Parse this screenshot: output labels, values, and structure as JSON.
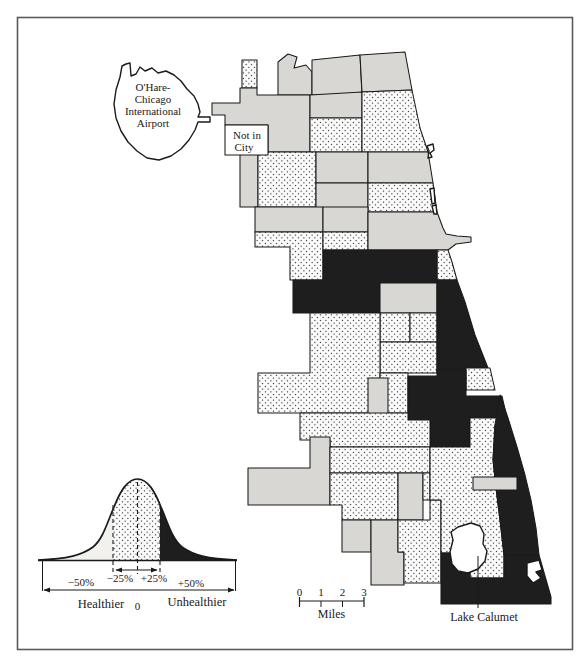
{
  "figure": {
    "colors": {
      "paper": "#ffffff",
      "gray": "#d8d7d3",
      "black": "#1e1e1e",
      "line": "#1a1a1a",
      "frame": "#5a5a5a",
      "light_tail": "#f2f1ed",
      "dot_bg": "#fdfdfd",
      "dot_ink": "#161616"
    },
    "labels": {
      "ohare": [
        "O'Hare-",
        "Chicago",
        "International",
        "Airport"
      ],
      "not_in_city": [
        "Not in",
        "City"
      ],
      "lake_calumet": "Lake Calumet"
    },
    "scale_bar": {
      "ticks": [
        "0",
        "1",
        "2",
        "3"
      ],
      "unit": "Miles"
    },
    "legend": {
      "minus50": "−50%",
      "minus25": "−25%",
      "plus25": "+25%",
      "plus50": "+50%",
      "zero": "0",
      "healthier": "Healthier",
      "unhealthier": "Unhealthier"
    },
    "map_regions": [
      {
        "id": "edison-strip",
        "fill": "dots",
        "pts": "242,60 257,60 257,88 242,88"
      },
      {
        "id": "forest-glen",
        "fill": "gray",
        "pts": "278,62 288,54 297,57 294,68 306,65 312,72 312,95 278,95"
      },
      {
        "id": "norwood-park",
        "fill": "gray",
        "pts": "212,103 240,103 240,88 257,88 257,95 310,95 310,152 268,152 268,125 225,125 225,115 212,115"
      },
      {
        "id": "west-ridge",
        "fill": "gray",
        "pts": "312,60 360,55 362,95 312,95"
      },
      {
        "id": "rogers-park",
        "fill": "gray",
        "pts": "360,55 405,52 412,90 362,92"
      },
      {
        "id": "north-park",
        "fill": "gray",
        "pts": "310,95 362,92 362,118 310,118"
      },
      {
        "id": "albany-park",
        "fill": "dots",
        "pts": "310,118 362,118 362,152 310,152"
      },
      {
        "id": "edgewater-uptown",
        "fill": "dots",
        "pts": "362,92 412,90 420,128 428,152 362,152"
      },
      {
        "id": "dunning",
        "fill": "gray",
        "pts": "240,152 258,152 258,207 240,207"
      },
      {
        "id": "portage-irving",
        "fill": "dots",
        "pts": "258,152 316,152 316,207 258,207"
      },
      {
        "id": "north-center",
        "fill": "gray",
        "pts": "316,152 368,152 368,183 316,183"
      },
      {
        "id": "lincoln-park",
        "fill": "gray",
        "pts": "368,152 428,152 433,183 368,183"
      },
      {
        "id": "lakeview-west",
        "fill": "gray",
        "pts": "316,183 368,183 368,212 316,212"
      },
      {
        "id": "near-north",
        "fill": "dots",
        "pts": "368,183 433,183 437,212 368,212"
      },
      {
        "id": "belmont-hermosa",
        "fill": "gray",
        "pts": "255,207 323,207 323,232 255,232"
      },
      {
        "id": "austin",
        "fill": "dots",
        "pts": "255,232 323,232 323,280 290,280 290,247 255,247"
      },
      {
        "id": "logan-square",
        "fill": "gray",
        "pts": "323,207 368,207 368,232 323,232"
      },
      {
        "id": "humboldt",
        "fill": "dots",
        "pts": "323,232 368,232 368,250 323,250"
      },
      {
        "id": "loop-near-north",
        "fill": "gray",
        "pts": "368,212 437,212 443,228 446,234 457,236 471,237 471,242 456,244 448,250 368,250"
      },
      {
        "id": "douglas-shore",
        "fill": "dots",
        "pts": "437,250 448,250 452,262 457,280 437,280"
      },
      {
        "id": "west-side-black",
        "fill": "black",
        "pts": "323,250 437,250 437,283 380,283 380,313 293,313 293,280 323,280"
      },
      {
        "id": "near-south-gray",
        "fill": "gray",
        "pts": "380,283 437,283 437,313 380,313"
      },
      {
        "id": "washington-park",
        "fill": "dots",
        "pts": "380,313 410,313 410,342 380,342"
      },
      {
        "id": "hyde-park-west",
        "fill": "dots",
        "pts": "410,313 437,313 437,342 410,342"
      },
      {
        "id": "woodlawn",
        "fill": "dots",
        "pts": "380,342 437,342 437,373 380,373"
      },
      {
        "id": "lakefront-black",
        "fill": "black",
        "pts": "437,280 457,280 465,302 475,335 488,368 466,368 466,373 437,373"
      },
      {
        "id": "south-shore-dots",
        "fill": "dots",
        "pts": "466,368 490,368 495,390 466,390"
      },
      {
        "id": "pilsen-littlevillage",
        "fill": "dots",
        "pts": "310,313 380,313 380,413 258,413 258,373 310,373"
      },
      {
        "id": "gage-strip",
        "fill": "dots",
        "pts": "380,373 408,373 408,413 380,413"
      },
      {
        "id": "brighton-gray",
        "fill": "gray",
        "pts": "368,378 388,378 388,437 368,437"
      },
      {
        "id": "chatham-black",
        "fill": "black",
        "pts": "408,376 437,376 437,370 466,370 466,396 502,396 507,418 470,418 470,447 430,447 430,420 408,420"
      },
      {
        "id": "sw-dots-1",
        "fill": "dots",
        "pts": "300,413 408,413 408,420 430,420 430,447 330,447 330,440 300,440"
      },
      {
        "id": "clearing-gray",
        "fill": "gray",
        "pts": "248,468 310,468 310,437 330,437 330,505 248,505"
      },
      {
        "id": "sw-dots-2",
        "fill": "dots",
        "pts": "330,447 430,447 430,473 330,473"
      },
      {
        "id": "ashburn-dots",
        "fill": "dots",
        "pts": "330,473 398,473 398,520 342,520 342,505 330,505"
      },
      {
        "id": "beverly-gray",
        "fill": "gray",
        "pts": "398,473 423,473 423,520 398,520"
      },
      {
        "id": "pullman-west-dots",
        "fill": "dots",
        "pts": "423,473 430,473 430,500 423,500"
      },
      {
        "id": "mount-greenwood",
        "fill": "gray",
        "pts": "342,520 371,520 371,552 342,552"
      },
      {
        "id": "morgan-park",
        "fill": "gray",
        "pts": "371,520 398,520 398,552 404,552 404,585 371,585"
      },
      {
        "id": "washington-heights",
        "fill": "dots",
        "pts": "398,520 430,520 430,500 441,500 441,583 404,583 404,552 398,552"
      },
      {
        "id": "far-south-dots",
        "fill": "dots",
        "pts": "430,447 470,447 470,418 507,418 495,425 493,460 496,488 500,520 504,555 504,578 470,578 470,553 441,553 441,500 430,500"
      },
      {
        "id": "southeast-black-band",
        "fill": "black",
        "pts": "500,395 508,418 517,447 525,475 531,500 536,528 539,555 504,555 500,520 496,488 493,460 495,425"
      },
      {
        "id": "southeast-gray-pocket",
        "fill": "gray",
        "pts": "473,477 517,477 517,490 473,490"
      },
      {
        "id": "bottom-black",
        "fill": "black",
        "pts": "441,553 470,553 470,578 504,578 504,555 539,555 551,597 551,604 441,604"
      },
      {
        "id": "not-in-city-area",
        "fill": "white",
        "pts": "225,125 268,125 268,155 225,155"
      },
      {
        "id": "lake-calumet-water",
        "fill": "water",
        "pts": "458,527 471,523 480,526 484,534 483,544 487,551 485,561 478,569 468,573 458,571 452,564 450,552 453,540 451,532"
      },
      {
        "id": "hegewisch-water",
        "fill": "water",
        "pts": "527,563 539,560 542,570 536,572 541,578 533,583 527,576"
      },
      {
        "id": "shore-sliver-1",
        "fill": "water",
        "pts": "430,189 434,188 435,203 432,204"
      },
      {
        "id": "shore-sliver-2",
        "fill": "water",
        "pts": "432,206 436,205 437,214 434,214"
      },
      {
        "id": "shore-hook",
        "fill": "water",
        "pts": "427,146 433,144 434,150 430,153 432,157 428,158 429,151"
      },
      {
        "id": "ohare-airport",
        "fill": "white",
        "pts": "126,64 130,63 131,76 136,74 140,67 145,71 152,68 158,73 166,71 174,75 181,81 187,89 194,96 198,104 200,112 198,117 210,117 210,122 198,122 195,130 189,140 181,149 171,156 159,160 147,158 137,151 128,142 121,131 116,118 114,104 116,90 120,77 122,66"
      }
    ]
  },
  "chart_data": {
    "type": "area",
    "xlabel": "Percent deviation from average health",
    "x_ticks": [
      "−50%",
      "−25%",
      "0",
      "+25%",
      "+50%"
    ],
    "series": [
      {
        "name": "Healthier tail (light)",
        "range": [
          "-50%",
          "-25%"
        ]
      },
      {
        "name": "Near average (stippled)",
        "range": [
          "-25%",
          "+25%"
        ]
      },
      {
        "name": "Unhealthier tail (black)",
        "range": [
          "+25%",
          "+50%"
        ]
      }
    ],
    "annotations": [
      "Healthier",
      "Unhealthier"
    ]
  }
}
